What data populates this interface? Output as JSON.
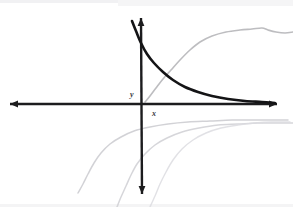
{
  "figure": {
    "background_color": "#ffffff",
    "width": 293,
    "height": 207
  },
  "axes": {
    "origin": {
      "x": 142,
      "y": 104
    },
    "x_axis": {
      "name": "x-axis",
      "label": "x",
      "label_position": {
        "x": 152,
        "y": 110
      },
      "color": "#1c1c1e",
      "stroke_width": 2.4,
      "start": {
        "x": 10,
        "y": 104
      },
      "end": {
        "x": 277,
        "y": 104
      },
      "arrow_left": true,
      "arrow_right": true
    },
    "y_axis": {
      "name": "y-axis",
      "label": "y",
      "label_position": {
        "x": 130,
        "y": 91
      },
      "color": "#1c1c1e",
      "stroke_width": 2.4,
      "start": {
        "x": 141,
        "y": 18
      },
      "end": {
        "x": 142,
        "y": 194
      },
      "arrow_top": true,
      "arrow_bottom": true
    }
  },
  "chart_data": {
    "type": "line",
    "xlabel": "x",
    "ylabel": "y",
    "grid": false,
    "legend": false,
    "xlim": [
      10,
      277
    ],
    "ylim": [
      194,
      18
    ],
    "series": [
      {
        "name": "exponential-decay-curve",
        "description": "Main bold decaying exponential approaching the x-axis asymptotically",
        "color": "#141416",
        "stroke_width": 2.6,
        "opacity": 1,
        "points": [
          [
            132,
            21
          ],
          [
            136,
            31
          ],
          [
            141,
            43
          ],
          [
            147,
            54
          ],
          [
            154,
            63
          ],
          [
            163,
            72
          ],
          [
            173,
            80
          ],
          [
            185,
            87
          ],
          [
            198,
            92
          ],
          [
            212,
            96
          ],
          [
            228,
            99
          ],
          [
            245,
            101
          ],
          [
            262,
            102
          ],
          [
            275,
            103
          ]
        ]
      },
      {
        "name": "faint-sigmoid-curve",
        "description": "Faint grey S-shaped rising curve in the upper right quadrant",
        "color": "#b9b9bd",
        "stroke_width": 1.6,
        "opacity": 0.95,
        "points": [
          [
            145,
            102
          ],
          [
            150,
            96
          ],
          [
            156,
            88
          ],
          [
            163,
            79
          ],
          [
            171,
            70
          ],
          [
            180,
            60
          ],
          [
            190,
            50
          ],
          [
            200,
            42
          ],
          [
            212,
            36
          ],
          [
            226,
            32
          ],
          [
            240,
            30
          ],
          [
            252,
            29
          ],
          [
            262,
            28
          ],
          [
            268,
            30
          ],
          [
            276,
            32
          ],
          [
            285,
            33
          ],
          [
            293,
            32
          ]
        ]
      },
      {
        "name": "faint-log-curve-outer",
        "description": "Faint grey logarithmic curve starting low left, flattening to the right",
        "color": "#cdcdd1",
        "stroke_width": 1.5,
        "opacity": 0.9,
        "points": [
          [
            78,
            193
          ],
          [
            83,
            184
          ],
          [
            88,
            174
          ],
          [
            94,
            163
          ],
          [
            101,
            153
          ],
          [
            110,
            144
          ],
          [
            121,
            137
          ],
          [
            134,
            131
          ],
          [
            150,
            127
          ],
          [
            168,
            124
          ],
          [
            188,
            122
          ],
          [
            210,
            121
          ],
          [
            232,
            120
          ],
          [
            252,
            120
          ],
          [
            270,
            120
          ],
          [
            288,
            120
          ]
        ]
      },
      {
        "name": "faint-log-curve-middle",
        "description": "Second faint grey logarithmic curve, steeper, crossing below the origin",
        "color": "#d2d2d6",
        "stroke_width": 1.5,
        "opacity": 0.9,
        "points": [
          [
            117,
            207
          ],
          [
            121,
            197
          ],
          [
            126,
            186
          ],
          [
            131,
            175
          ],
          [
            137,
            164
          ],
          [
            145,
            154
          ],
          [
            155,
            145
          ],
          [
            167,
            138
          ],
          [
            182,
            132
          ],
          [
            199,
            128
          ],
          [
            218,
            125
          ],
          [
            238,
            124
          ],
          [
            258,
            123
          ],
          [
            278,
            123
          ],
          [
            293,
            123
          ]
        ]
      },
      {
        "name": "faint-log-curve-inner",
        "description": "Third faint grey logarithmic curve nearest the x-axis",
        "color": "#dcdce0",
        "stroke_width": 1.4,
        "opacity": 0.85,
        "points": [
          [
            150,
            207
          ],
          [
            155,
            196
          ],
          [
            160,
            184
          ],
          [
            166,
            172
          ],
          [
            173,
            160
          ],
          [
            182,
            149
          ],
          [
            193,
            140
          ],
          [
            206,
            133
          ],
          [
            221,
            128
          ],
          [
            238,
            125
          ],
          [
            255,
            123
          ],
          [
            272,
            122
          ],
          [
            290,
            122
          ]
        ]
      }
    ],
    "annotations": [
      {
        "text": "y",
        "x": 133,
        "y": 96
      },
      {
        "text": "x",
        "x": 155,
        "y": 115
      }
    ]
  },
  "paper": {
    "top_edge_color": "#f1f1f3",
    "bottom_edge_color": "#f4f4f5"
  }
}
